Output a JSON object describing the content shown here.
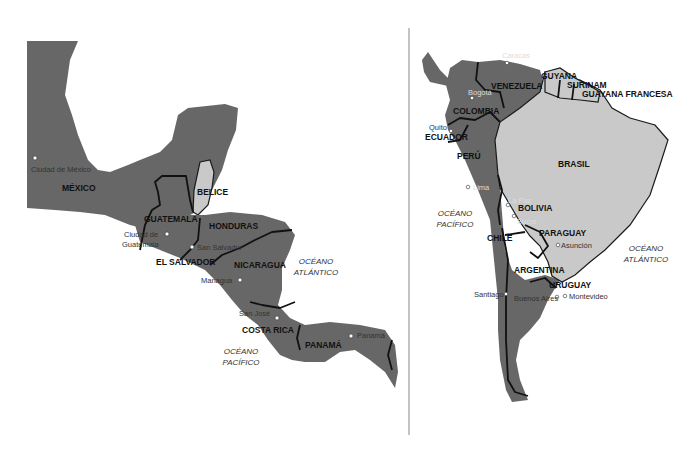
{
  "colors": {
    "land_dark": "#676767",
    "land_light": "#c9c9c9",
    "border": "#111111",
    "background": "#ffffff"
  },
  "central_america": {
    "countries": [
      "MÉXICO",
      "BELICE",
      "GUATEMALA",
      "HONDURAS",
      "EL SALVADOR",
      "NICARAGUA",
      "COSTA RICA",
      "PANAMÁ"
    ],
    "cities": [
      "Ciudad de México",
      "Ciudad de Guatemala",
      "San Salvador",
      "Managua",
      "San José",
      "Panamá"
    ],
    "city_guatemala_line1": "Ciudad de",
    "city_guatemala_line2": "Guatemala",
    "oceans": {
      "atlantic_line1": "OCÉANO",
      "atlantic_line2": "ATLÁNTICO",
      "pacific_line1": "OCÉANO",
      "pacific_line2": "PACÍFICO"
    }
  },
  "south_america": {
    "countries": [
      "GUYANA",
      "SURINAM",
      "GUAYANA FRANCESA",
      "VENEZUELA",
      "COLOMBIA",
      "ECUADOR",
      "PERÚ",
      "BRASIL",
      "BOLIVIA",
      "PARAGUAY",
      "CHILE",
      "ARGENTINA",
      "URUGUAY"
    ],
    "cities": [
      "Caracas",
      "Bogotá",
      "Quito",
      "Lima",
      "La Paz",
      "Sucre",
      "Asunción",
      "Santiago",
      "Buenos Aires",
      "Montevideo"
    ],
    "oceans": {
      "atlantic_line1": "OCÉANO",
      "atlantic_line2": "ATLÁNTICO",
      "pacific_line1": "OCÉANO",
      "pacific_line2": "PACÍFICO"
    }
  }
}
